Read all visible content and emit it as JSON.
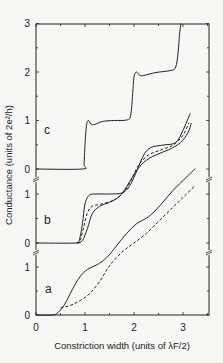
{
  "chart_data": {
    "type": "line",
    "title": "",
    "xlabel": "Constriction width (units of λF/2)",
    "ylabel": "Conductance (units of 2e²/h)",
    "xlim": [
      0,
      3.55
    ],
    "x_ticks": [
      "0",
      "1",
      "2",
      "3"
    ],
    "grid": false,
    "legend": null,
    "panels": [
      {
        "label": "c",
        "y_ticks": [
          "0",
          "1",
          "2",
          "3"
        ],
        "ylim": [
          0,
          3
        ],
        "series": [
          {
            "name": "c-solid",
            "style": "solid",
            "points": [
              [
                0,
                0
              ],
              [
                0.95,
                0
              ],
              [
                0.98,
                0.1
              ],
              [
                1.0,
                0.5
              ],
              [
                1.03,
                0.9
              ],
              [
                1.07,
                1.0
              ],
              [
                1.12,
                0.93
              ],
              [
                1.2,
                0.92
              ],
              [
                1.35,
                0.98
              ],
              [
                1.6,
                1.0
              ],
              [
                1.85,
                1.01
              ],
              [
                1.93,
                1.1
              ],
              [
                1.97,
                1.5
              ],
              [
                2.0,
                1.9
              ],
              [
                2.05,
                2.0
              ],
              [
                2.12,
                1.93
              ],
              [
                2.2,
                1.93
              ],
              [
                2.45,
                1.99
              ],
              [
                2.75,
                2.03
              ],
              [
                2.85,
                2.1
              ],
              [
                2.9,
                2.4
              ],
              [
                2.93,
                2.8
              ],
              [
                2.96,
                3.0
              ]
            ]
          }
        ]
      },
      {
        "label": "b",
        "y_ticks": [
          "0",
          "1"
        ],
        "ylim": [
          0,
          2.2
        ],
        "series": [
          {
            "name": "b-solid-1",
            "style": "solid",
            "points": [
              [
                0,
                0
              ],
              [
                0.8,
                0
              ],
              [
                0.88,
                0.05
              ],
              [
                0.95,
                0.4
              ],
              [
                1.0,
                0.8
              ],
              [
                1.08,
                0.97
              ],
              [
                1.2,
                1.0
              ],
              [
                1.5,
                1.0
              ],
              [
                1.75,
                1.02
              ],
              [
                1.9,
                1.15
              ],
              [
                2.05,
                1.45
              ],
              [
                2.2,
                1.8
              ],
              [
                2.35,
                1.95
              ],
              [
                2.6,
                2.0
              ],
              [
                2.85,
                2.05
              ],
              [
                3.0,
                2.3
              ],
              [
                3.15,
                2.65
              ]
            ]
          },
          {
            "name": "b-dashed",
            "style": "dashed",
            "points": [
              [
                0.82,
                0
              ],
              [
                0.9,
                0.05
              ],
              [
                0.98,
                0.35
              ],
              [
                1.05,
                0.62
              ],
              [
                1.15,
                0.75
              ],
              [
                1.35,
                0.8
              ],
              [
                1.6,
                0.88
              ],
              [
                1.8,
                1.05
              ],
              [
                1.95,
                1.3
              ],
              [
                2.1,
                1.6
              ],
              [
                2.3,
                1.8
              ],
              [
                2.55,
                1.9
              ],
              [
                2.8,
                2.0
              ],
              [
                3.0,
                2.2
              ],
              [
                3.12,
                2.45
              ]
            ]
          },
          {
            "name": "b-solid-2",
            "style": "solid",
            "points": [
              [
                0.85,
                0
              ],
              [
                0.95,
                0.05
              ],
              [
                1.05,
                0.3
              ],
              [
                1.15,
                0.6
              ],
              [
                1.3,
                0.75
              ],
              [
                1.5,
                0.83
              ],
              [
                1.7,
                0.95
              ],
              [
                1.85,
                1.15
              ],
              [
                2.0,
                1.4
              ],
              [
                2.2,
                1.65
              ],
              [
                2.45,
                1.8
              ],
              [
                2.7,
                1.9
              ],
              [
                2.95,
                2.05
              ],
              [
                3.1,
                2.25
              ],
              [
                3.17,
                2.45
              ]
            ]
          }
        ]
      },
      {
        "label": "a",
        "y_ticks": [
          "0",
          "1"
        ],
        "ylim": [
          0,
          3.3
        ],
        "series": [
          {
            "name": "a-solid",
            "style": "solid",
            "points": [
              [
                0,
                0
              ],
              [
                0.32,
                0
              ],
              [
                0.45,
                0.05
              ],
              [
                0.6,
                0.25
              ],
              [
                0.75,
                0.55
              ],
              [
                0.9,
                0.8
              ],
              [
                1.05,
                0.95
              ],
              [
                1.25,
                1.05
              ],
              [
                1.45,
                1.2
              ],
              [
                1.65,
                1.45
              ],
              [
                1.85,
                1.7
              ],
              [
                2.05,
                1.9
              ],
              [
                2.3,
                2.05
              ],
              [
                2.55,
                2.3
              ],
              [
                2.8,
                2.6
              ],
              [
                3.05,
                2.85
              ],
              [
                3.25,
                3.05
              ]
            ]
          },
          {
            "name": "a-dashed",
            "style": "dashed",
            "points": [
              [
                0.5,
                0.15
              ],
              [
                0.7,
                0.2
              ],
              [
                0.9,
                0.3
              ],
              [
                1.1,
                0.45
              ],
              [
                1.3,
                0.7
              ],
              [
                1.45,
                0.95
              ],
              [
                1.6,
                1.15
              ],
              [
                1.8,
                1.35
              ],
              [
                2.0,
                1.5
              ],
              [
                2.25,
                1.7
              ],
              [
                2.5,
                1.95
              ],
              [
                2.75,
                2.2
              ],
              [
                3.0,
                2.45
              ],
              [
                3.25,
                2.7
              ]
            ]
          }
        ]
      }
    ]
  }
}
